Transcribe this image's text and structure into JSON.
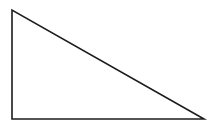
{
  "canvas": {
    "width": 213,
    "height": 128,
    "background_color": "#ffffff",
    "title": "Right triangle line drawing"
  },
  "figure": {
    "name": "right-triangle",
    "kind": "polygon",
    "filled": false,
    "stroke_color": "#1c1c1c",
    "stroke_width": 1.6,
    "points_attr": "12,10 12,119 204,119",
    "vertices": [
      {
        "label": "top-left-vertex",
        "x": 12,
        "y": 10
      },
      {
        "label": "bottom-left-vertex",
        "x": 12,
        "y": 119
      },
      {
        "label": "bottom-right-vertex",
        "x": 204,
        "y": 119
      }
    ],
    "edges": [
      {
        "label": "vertical-leg",
        "from": "top-left-vertex",
        "to": "bottom-left-vertex",
        "length_px": 109
      },
      {
        "label": "horizontal-leg",
        "from": "bottom-left-vertex",
        "to": "bottom-right-vertex",
        "length_px": 192
      },
      {
        "label": "hypotenuse",
        "from": "top-left-vertex",
        "to": "bottom-right-vertex",
        "length_px": 221
      }
    ],
    "right_angle_at": "bottom-left-vertex"
  }
}
